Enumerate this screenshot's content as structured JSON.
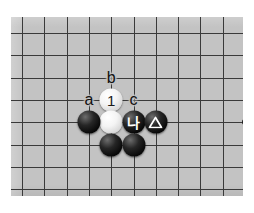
{
  "diagram": {
    "kind": "go-board-diagram",
    "board": {
      "background_color": "#c3c3c3",
      "line_color": "#3a3a3a",
      "grid": {
        "cols": 11,
        "rows": 8,
        "spacing_px": 22.3,
        "origin_x": 11,
        "origin_y": 16
      },
      "star_points": [
        {
          "col": 10,
          "row": 4,
          "label": "hoshi"
        }
      ]
    },
    "stones": [
      {
        "id": "w1",
        "color": "white",
        "col": 4,
        "row": 3,
        "label": "1",
        "marker": "number"
      },
      {
        "id": "w2",
        "color": "white",
        "col": 4,
        "row": 4,
        "label": "",
        "marker": "none"
      },
      {
        "id": "b1",
        "color": "black",
        "col": 3,
        "row": 4,
        "label": "",
        "marker": "none"
      },
      {
        "id": "b2",
        "color": "black",
        "col": 5,
        "row": 4,
        "label": "나",
        "marker": "korean-letter"
      },
      {
        "id": "b3",
        "color": "black",
        "col": 6,
        "row": 4,
        "label": "",
        "marker": "triangle"
      },
      {
        "id": "b4",
        "color": "black",
        "col": 4,
        "row": 5,
        "label": "",
        "marker": "none"
      },
      {
        "id": "b5",
        "color": "black",
        "col": 5,
        "row": 5,
        "label": "",
        "marker": "none"
      }
    ],
    "point_labels": [
      {
        "id": "lbl-b",
        "text": "b",
        "col": 4,
        "row": 2
      },
      {
        "id": "lbl-a",
        "text": "a",
        "col": 3,
        "row": 3
      },
      {
        "id": "lbl-c",
        "text": "c",
        "col": 5,
        "row": 3
      }
    ],
    "colors": {
      "page_background": "#ffffff",
      "stone_black": "#0a0a0a",
      "stone_white": "#f4f4f4",
      "marker_on_black": "#ffffff",
      "marker_on_white": "#1a1a1a"
    }
  }
}
